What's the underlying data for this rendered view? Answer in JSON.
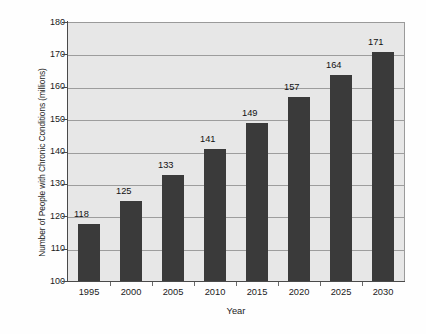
{
  "chart_data": {
    "type": "bar",
    "title": "",
    "subtitle": "",
    "xlabel": "Year",
    "ylabel": "Number of People with Chronic Conditions (millions)",
    "categories": [
      "1995",
      "2000",
      "2005",
      "2010",
      "2015",
      "2020",
      "2025",
      "2030"
    ],
    "values": [
      118,
      125,
      133,
      141,
      149,
      157,
      164,
      171
    ],
    "data_labels": [
      "118",
      "125",
      "133",
      "141",
      "149",
      "157",
      "164",
      "171"
    ],
    "ylim": [
      100,
      180
    ],
    "yticks": [
      100,
      110,
      120,
      130,
      140,
      150,
      160,
      170,
      180
    ],
    "ytick_labels": [
      "100",
      "110",
      "120",
      "130",
      "140",
      "150",
      "160",
      "170",
      "180"
    ],
    "gridlines": [
      110,
      120,
      130,
      140,
      150,
      160,
      170
    ],
    "grid": true,
    "legend": false,
    "legend_position": "none",
    "series": [
      {
        "name": "Number of People with Chronic Conditions (millions)",
        "values": [
          118,
          125,
          133,
          141,
          149,
          157,
          164,
          171
        ]
      }
    ],
    "colors": {
      "bar": "#3a3a3a",
      "plot_background": "#e7e7e7",
      "page_background": "#fefefe",
      "gridline": "#9d9d9d",
      "axis": "#4a4a4a",
      "text": "#1b1b1b"
    }
  }
}
